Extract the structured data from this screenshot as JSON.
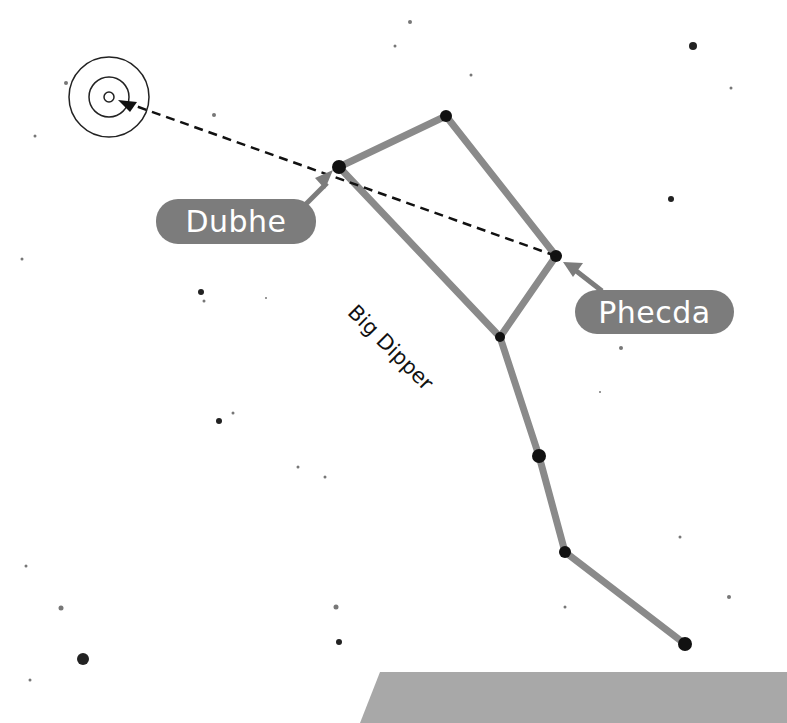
{
  "constellation": {
    "name": "Big Dipper",
    "line_color": "#8a8a8a",
    "star_color": "#111111",
    "stars": [
      {
        "name": "Dubhe",
        "x": 339,
        "y": 167,
        "r": 7
      },
      {
        "name": "Merak-top",
        "x": 446,
        "y": 116,
        "r": 6
      },
      {
        "name": "Phecda",
        "x": 556,
        "y": 256,
        "r": 6
      },
      {
        "name": "Megrez",
        "x": 500,
        "y": 337,
        "r": 5
      },
      {
        "name": "Alioth",
        "x": 539,
        "y": 456,
        "r": 7
      },
      {
        "name": "Mizar",
        "x": 565,
        "y": 552,
        "r": 6
      },
      {
        "name": "Alkaid",
        "x": 685,
        "y": 644,
        "r": 7
      }
    ],
    "lines": [
      [
        0,
        1
      ],
      [
        1,
        2
      ],
      [
        2,
        3
      ],
      [
        3,
        0
      ],
      [
        3,
        4
      ],
      [
        4,
        5
      ],
      [
        5,
        6
      ]
    ]
  },
  "labels": {
    "dubhe": "Dubhe",
    "phecda": "Phecda",
    "constellation": "Big Dipper"
  },
  "pointer_line": {
    "from": [
      556,
      256
    ],
    "to": [
      118,
      100
    ],
    "style": "dashed"
  },
  "target": {
    "cx": 109,
    "cy": 97,
    "radii": [
      40,
      20,
      5
    ]
  },
  "background_stars": [
    [
      693,
      46,
      4
    ],
    [
      731,
      88,
      1.5
    ],
    [
      671,
      199,
      3
    ],
    [
      410,
      22,
      2
    ],
    [
      395,
      46,
      1.5
    ],
    [
      471,
      75,
      1.5
    ],
    [
      214,
      115,
      2
    ],
    [
      66,
      83,
      2
    ],
    [
      35,
      136,
      1.5
    ],
    [
      22,
      259,
      1.5
    ],
    [
      201,
      292,
      3
    ],
    [
      204,
      301,
      1.5
    ],
    [
      266,
      298,
      1
    ],
    [
      219,
      421,
      3
    ],
    [
      233,
      413,
      1.5
    ],
    [
      30,
      680,
      1.5
    ],
    [
      61,
      608,
      2.5
    ],
    [
      83,
      659,
      6
    ],
    [
      26,
      566,
      1.5
    ],
    [
      336,
      607,
      2.5
    ],
    [
      339,
      642,
      3
    ],
    [
      298,
      467,
      1.5
    ],
    [
      325,
      477,
      1.5
    ],
    [
      621,
      348,
      2
    ],
    [
      729,
      597,
      2
    ],
    [
      680,
      537,
      1.5
    ],
    [
      565,
      607,
      1.5
    ],
    [
      600,
      392,
      1
    ]
  ],
  "ground": {
    "color": "#a8a8a8",
    "points": "380,672 787,672 787,723 360,723"
  }
}
